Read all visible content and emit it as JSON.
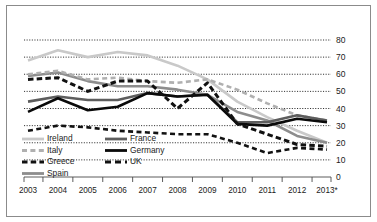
{
  "chart_data": {
    "type": "line",
    "title": "",
    "subtitle": "",
    "xlabel": "",
    "ylabel": "",
    "xlim_categories": [
      "2003",
      "2004",
      "2005",
      "2006",
      "2007",
      "2008",
      "2009",
      "2010",
      "2011",
      "2012",
      "2013*"
    ],
    "ylim": [
      0,
      80
    ],
    "yticks": [
      0,
      10,
      20,
      30,
      40,
      50,
      60,
      70,
      80
    ],
    "grid": true,
    "grid_style": "dotted-horizontal",
    "legend_position": "bottom-left",
    "x": [
      "2003",
      "2004",
      "2005",
      "2006",
      "2007",
      "2008",
      "2009",
      "2010",
      "2011",
      "2012",
      "2013*"
    ],
    "series": [
      {
        "name": "Ireland",
        "color": "#c9c9c9",
        "style": "solid",
        "width": 2.6,
        "values": [
          68,
          74,
          70,
          73,
          71,
          65,
          57,
          44,
          35,
          27,
          20
        ]
      },
      {
        "name": "Italy",
        "color": "#b0b0b0",
        "style": "dashed",
        "width": 2.6,
        "values": [
          60,
          62,
          57,
          58,
          56,
          55,
          57,
          51,
          43,
          36,
          33
        ]
      },
      {
        "name": "Greece",
        "color": "#111111",
        "style": "dashed-thick",
        "width": 3.0,
        "values": [
          57,
          58,
          50,
          56,
          56,
          40,
          55,
          31,
          25,
          19,
          18
        ]
      },
      {
        "name": "Spain",
        "color": "#8d8d8d",
        "style": "solid",
        "width": 2.6,
        "values": [
          59,
          61,
          56,
          53,
          53,
          51,
          48,
          38,
          33,
          24,
          20
        ]
      },
      {
        "name": "France",
        "color": "#5d5d5d",
        "style": "solid",
        "width": 2.6,
        "values": [
          44,
          47,
          45,
          45,
          49,
          47,
          48,
          32,
          32,
          36,
          33
        ]
      },
      {
        "name": "Germany",
        "color": "#0a0a0a",
        "style": "solid",
        "width": 2.6,
        "values": [
          38,
          46,
          39,
          41,
          49,
          47,
          48,
          31,
          30,
          34,
          32
        ]
      },
      {
        "name": "UK",
        "color": "#121212",
        "style": "dashed",
        "width": 2.6,
        "values": [
          27,
          30,
          29,
          27,
          26,
          25,
          25,
          20,
          14,
          17,
          16
        ]
      }
    ]
  },
  "axis": {
    "y_tick_labels": [
      "80",
      "70",
      "60",
      "50",
      "40",
      "30",
      "20",
      "10",
      "0"
    ],
    "x_tick_labels": [
      "2003",
      "2004",
      "2005",
      "2006",
      "2007",
      "2008",
      "2009",
      "2010",
      "2011",
      "2012",
      "2013*"
    ]
  },
  "legend": {
    "entries": [
      {
        "label": "Ireland",
        "swatch": "ireland-swatch"
      },
      {
        "label": "France",
        "swatch": "france-swatch"
      },
      {
        "label": "Italy",
        "swatch": "italy-swatch"
      },
      {
        "label": "Germany",
        "swatch": "germany-swatch"
      },
      {
        "label": "Greece",
        "swatch": "greece-swatch"
      },
      {
        "label": "UK",
        "swatch": "uk-swatch"
      },
      {
        "label": "Spain",
        "swatch": "spain-swatch"
      }
    ]
  }
}
